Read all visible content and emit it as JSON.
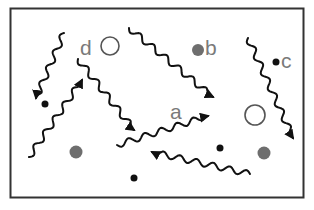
{
  "diagram": {
    "frame": {
      "x": 10,
      "y": 8,
      "width": 294,
      "height": 190,
      "stroke": "#333333"
    },
    "colors": {
      "photon": "#111111",
      "label": "#7a7a7a",
      "gray_particle": "#6e6e6e",
      "black_particle": "#111111",
      "hollow_particle_stroke": "#555555"
    },
    "labels": [
      {
        "id": "a",
        "text": "a",
        "x": 170,
        "y": 119
      },
      {
        "id": "b",
        "text": "b",
        "x": 205,
        "y": 55
      },
      {
        "id": "c",
        "text": "c",
        "x": 281,
        "y": 68
      },
      {
        "id": "d",
        "text": "d",
        "x": 80,
        "y": 55
      }
    ],
    "particles": [
      {
        "type": "hollow",
        "label": "d",
        "cx": 110,
        "cy": 46,
        "r": 9
      },
      {
        "type": "gray",
        "label": "b",
        "cx": 198,
        "cy": 50,
        "r": 6
      },
      {
        "type": "black",
        "label": "c",
        "cx": 276,
        "cy": 62,
        "r": 3.5
      },
      {
        "type": "hollow",
        "cx": 255,
        "cy": 115,
        "r": 10
      },
      {
        "type": "gray",
        "cx": 76,
        "cy": 152,
        "r": 6.5
      },
      {
        "type": "gray",
        "cx": 264,
        "cy": 153,
        "r": 6.5
      },
      {
        "type": "black",
        "cx": 45,
        "cy": 104,
        "r": 3.5
      },
      {
        "type": "black",
        "cx": 220,
        "cy": 148,
        "r": 3.5
      },
      {
        "type": "black",
        "cx": 134,
        "cy": 178,
        "r": 3.5
      }
    ],
    "photons": [
      {
        "id": "photon-1",
        "direction": "down-left",
        "from": [
          64,
          33
        ],
        "to": [
          36,
          98
        ]
      },
      {
        "id": "photon-2",
        "direction": "up-right",
        "from": [
          29,
          157
        ],
        "to": [
          82,
          80
        ]
      },
      {
        "id": "photon-3",
        "direction": "down-right",
        "from": [
          78,
          59
        ],
        "to": [
          134,
          130
        ]
      },
      {
        "id": "photon-4",
        "direction": "down-right",
        "from": [
          129,
          28
        ],
        "to": [
          213,
          97
        ]
      },
      {
        "id": "photon-5",
        "label": "a",
        "direction": "right",
        "from": [
          117,
          145
        ],
        "to": [
          208,
          116
        ]
      },
      {
        "id": "photon-6",
        "direction": "down-right",
        "from": [
          248,
          38
        ],
        "to": [
          293,
          138
        ]
      },
      {
        "id": "photon-7",
        "direction": "up-left",
        "from": [
          250,
          174
        ],
        "to": [
          152,
          152
        ]
      }
    ]
  }
}
